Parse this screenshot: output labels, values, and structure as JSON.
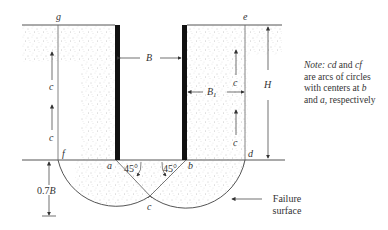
{
  "figure": {
    "type": "braced-cut-failure-diagram",
    "points": {
      "g": "g",
      "e": "e",
      "f": "f",
      "d": "d",
      "a": "a",
      "b": "b",
      "c": "c"
    },
    "dimensions": {
      "B": "B",
      "B1": "B",
      "B1_sub": "1",
      "H": "H",
      "depth_below": "0.7 B",
      "c_label": "c"
    },
    "angles": {
      "left": "45°",
      "right": "45°"
    },
    "failure_label_line1": "Failure",
    "failure_label_line2": "surface",
    "note": {
      "prefix": "Note: ",
      "arc1": "cd",
      "and1": " and ",
      "arc2": "cf",
      "line2": "are arcs of circles",
      "line3": "with centers at ",
      "center1": "b",
      "line4": "and ",
      "center2": "a",
      "line4_end": ", respectively"
    },
    "colors": {
      "line": "#555555",
      "pile": "#111111",
      "stipple": "#9a9a9a"
    }
  }
}
